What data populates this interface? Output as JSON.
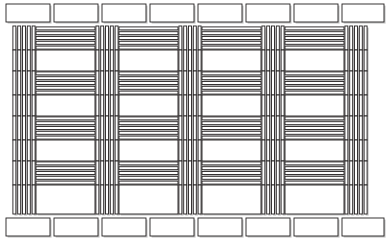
{
  "figure": {
    "kind": "line-art-pattern-diagram",
    "width": 389,
    "height": 240,
    "background_color": "#ffffff",
    "stroke_color": "#231f20",
    "fill_color": "#ffffff",
    "stroke_width": 0.9,
    "shadow_color": "#9a9a9a"
  },
  "geometry": {
    "field": {
      "x": 12,
      "y": 26,
      "width": 365,
      "height": 188
    },
    "band_thickness": 24,
    "plain_size": 24,
    "stripe_count": 5,
    "column_edges": [
      12,
      36,
      95,
      119,
      178,
      202,
      261,
      285,
      344,
      368
    ],
    "row_edges": [
      26,
      50,
      71,
      95,
      116,
      140,
      161,
      185,
      214
    ],
    "column_kinds": [
      "stripe",
      "plain",
      "stripe",
      "plain",
      "stripe",
      "plain",
      "stripe",
      "plain",
      "stripe"
    ],
    "row_kinds": [
      "stripe",
      "plain",
      "stripe",
      "plain",
      "stripe",
      "plain",
      "stripe",
      "plain"
    ]
  },
  "border": {
    "top_row": {
      "label": "top border course",
      "y": 4,
      "height": 18,
      "tile_count": 8,
      "tiles": [
        {
          "index": 1,
          "x": 6,
          "width": 44
        },
        {
          "index": 2,
          "x": 54,
          "width": 44
        },
        {
          "index": 3,
          "x": 102,
          "width": 44
        },
        {
          "index": 4,
          "x": 150,
          "width": 44
        },
        {
          "index": 5,
          "x": 198,
          "width": 44
        },
        {
          "index": 6,
          "x": 246,
          "width": 44
        },
        {
          "index": 7,
          "x": 294,
          "width": 44
        },
        {
          "index": 8,
          "x": 342,
          "width": 42
        }
      ]
    },
    "bottom_row": {
      "label": "bottom border course",
      "y": 218,
      "height": 18,
      "tile_count": 8,
      "tiles": [
        {
          "index": 1,
          "x": 6,
          "width": 44
        },
        {
          "index": 2,
          "x": 54,
          "width": 44
        },
        {
          "index": 3,
          "x": 102,
          "width": 44
        },
        {
          "index": 4,
          "x": 150,
          "width": 44
        },
        {
          "index": 5,
          "x": 198,
          "width": 44
        },
        {
          "index": 6,
          "x": 246,
          "width": 44
        },
        {
          "index": 7,
          "x": 294,
          "width": 44
        },
        {
          "index": 8,
          "x": 342,
          "width": 42
        }
      ]
    }
  },
  "grid": {
    "description": "Nine column slots by eight row slots. Striped slots carry five parallel lines; plain slots are open squares.",
    "columns": [
      {
        "index": 0,
        "x": 12,
        "width": 24,
        "kind": "stripe-vertical"
      },
      {
        "index": 1,
        "x": 36,
        "width": 59,
        "kind": "plain-wide"
      },
      {
        "index": 2,
        "x": 95,
        "width": 24,
        "kind": "stripe-vertical"
      },
      {
        "index": 3,
        "x": 119,
        "width": 59,
        "kind": "plain-wide"
      },
      {
        "index": 4,
        "x": 178,
        "width": 24,
        "kind": "stripe-vertical"
      },
      {
        "index": 5,
        "x": 202,
        "width": 59,
        "kind": "plain-wide"
      },
      {
        "index": 6,
        "x": 261,
        "width": 24,
        "kind": "stripe-vertical"
      },
      {
        "index": 7,
        "x": 285,
        "width": 59,
        "kind": "plain-wide"
      },
      {
        "index": 8,
        "x": 344,
        "width": 24,
        "kind": "stripe-vertical"
      }
    ],
    "rows": [
      {
        "index": 0,
        "y": 26,
        "height": 45,
        "kind": "plain-tall"
      },
      {
        "index": 1,
        "y": 71,
        "height": 24,
        "kind": "stripe-horizontal"
      },
      {
        "index": 2,
        "y": 95,
        "height": 45,
        "kind": "plain-tall"
      },
      {
        "index": 3,
        "y": 140,
        "height": 24,
        "kind": "stripe-horizontal"
      },
      {
        "index": 4,
        "y": 164,
        "height": 50,
        "kind": "plain-tall"
      }
    ]
  },
  "legend": {
    "vertical_band": "vertical five-line band",
    "horizontal_band": "horizontal five-line band",
    "plain_square": "plain open square",
    "border_tile": "plain border brick"
  }
}
